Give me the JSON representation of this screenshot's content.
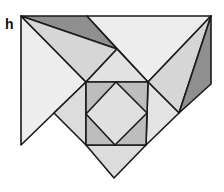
{
  "figure": {
    "label": "h",
    "colors": {
      "light": "#ededed",
      "mid": "#d6d6d6",
      "midDark": "#bdbdbd",
      "dark": "#8f8f8f",
      "stroke": "#1a1a1a"
    }
  }
}
